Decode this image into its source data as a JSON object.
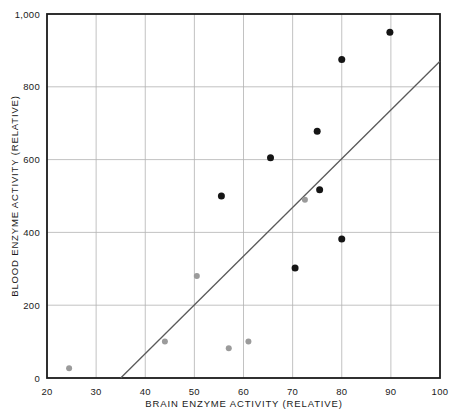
{
  "chart_data": {
    "type": "scatter",
    "title": "",
    "xlabel": "BRAIN ENZYME ACTIVITY (RELATIVE)",
    "ylabel": "BLOOD ENZYME ACTIVITY (RELATIVE)",
    "xlim": [
      20,
      100
    ],
    "ylim": [
      0,
      1000
    ],
    "grid": true,
    "legend": "none",
    "xticks": [
      20,
      30,
      40,
      50,
      60,
      70,
      80,
      90,
      100
    ],
    "xtick_labels": [
      "20",
      "30",
      "40",
      "50",
      "60",
      "70",
      "80",
      "90",
      "100"
    ],
    "yticks": [
      0,
      200,
      400,
      600,
      800,
      1000
    ],
    "ytick_labels": [
      "0",
      "200",
      "400",
      "600",
      "800",
      "1,000"
    ],
    "series": [
      {
        "name": "dark-points",
        "color": "#151515",
        "marker": "circle",
        "marker_size": 7,
        "points": [
          {
            "x": 55.5,
            "y": 500
          },
          {
            "x": 65.5,
            "y": 605
          },
          {
            "x": 70.5,
            "y": 302
          },
          {
            "x": 75.0,
            "y": 678
          },
          {
            "x": 75.5,
            "y": 517
          },
          {
            "x": 80.0,
            "y": 382
          },
          {
            "x": 80.0,
            "y": 875
          },
          {
            "x": 89.8,
            "y": 950
          }
        ]
      },
      {
        "name": "gray-points",
        "color": "#9b9b9b",
        "marker": "circle",
        "marker_size": 6,
        "points": [
          {
            "x": 24.5,
            "y": 27
          },
          {
            "x": 44.0,
            "y": 100
          },
          {
            "x": 50.5,
            "y": 280
          },
          {
            "x": 57.0,
            "y": 82
          },
          {
            "x": 61.0,
            "y": 100
          },
          {
            "x": 72.5,
            "y": 490
          }
        ]
      }
    ],
    "trend_line": {
      "name": "regression-line",
      "color": "#5a5a5a",
      "x0": 35,
      "y0": 0,
      "x1": 100,
      "y1": 870
    },
    "colors": {
      "axis": "#1a1a1a",
      "grid": "#b3b3b3",
      "background": "#ffffff",
      "dark_marker": "#151515",
      "gray_marker": "#9b9b9b",
      "trend": "#5a5a5a"
    }
  }
}
